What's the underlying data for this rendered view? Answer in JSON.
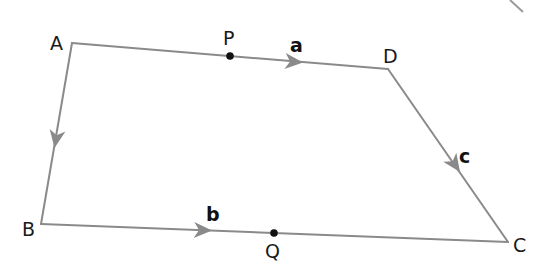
{
  "diagram": {
    "colors": {
      "edge": "#8a8a8a",
      "point": "#111111",
      "text": "#1a1a1a"
    },
    "vertices": {
      "A": {
        "label": "A",
        "x": 72,
        "y": 43
      },
      "B": {
        "label": "B",
        "x": 41,
        "y": 224
      },
      "C": {
        "label": "C",
        "x": 508,
        "y": 242
      },
      "D": {
        "label": "D",
        "x": 388,
        "y": 69
      }
    },
    "points": {
      "P": {
        "label": "P",
        "x": 230,
        "y": 56,
        "on_edge": "AD"
      },
      "Q": {
        "label": "Q",
        "x": 274,
        "y": 233,
        "on_edge": "BC"
      }
    },
    "edges": [
      {
        "from": "A",
        "to": "D",
        "vector": "a",
        "arrow_direction": "A→D"
      },
      {
        "from": "D",
        "to": "C",
        "vector": "c",
        "arrow_direction": "D→C"
      },
      {
        "from": "B",
        "to": "C",
        "vector": "b",
        "arrow_direction": "B→C"
      },
      {
        "from": "A",
        "to": "B",
        "vector": "",
        "arrow_direction": "A→B"
      }
    ],
    "vector_labels": {
      "a": "a",
      "b": "b",
      "c": "c"
    }
  }
}
